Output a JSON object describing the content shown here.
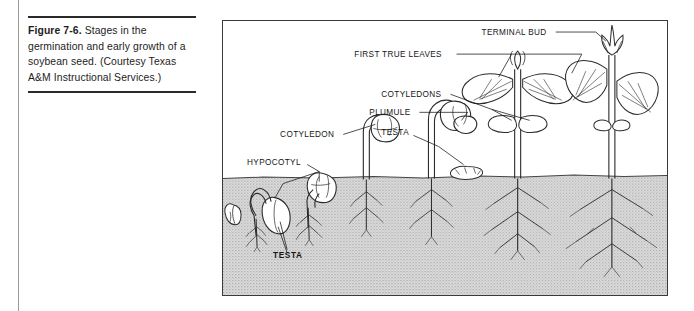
{
  "page": {
    "background": "#ffffff",
    "ink": "#2b2b2b"
  },
  "caption": {
    "label": "Figure 7-6.",
    "text": " Stages in the germination and early growth of a soybean seed. (Courtesy Texas A&M Instructional Services.)",
    "rule_color": "#2a2a2a"
  },
  "figure": {
    "border_color": "#3a3a3a",
    "soil_fill": "#d6d6d6",
    "sky_fill": "#ffffff",
    "labels": [
      {
        "id": "terminal-bud",
        "text": "TERMINAL BUD",
        "bold": false,
        "x": 258,
        "y": 14
      },
      {
        "id": "first-true-leaves",
        "text": "FIRST TRUE LEAVES",
        "bold": false,
        "x": 147,
        "y": 36
      },
      {
        "id": "cotyledons",
        "text": "COTYLEDONS",
        "bold": false,
        "x": 168,
        "y": 76
      },
      {
        "id": "plumule",
        "text": "PLUMULE",
        "bold": false,
        "x": 152,
        "y": 94
      },
      {
        "id": "testa-upper",
        "text": "TESTA",
        "bold": false,
        "x": 168,
        "y": 111
      },
      {
        "id": "cotyledon",
        "text": "COTYLEDON",
        "bold": false,
        "x": 62,
        "y": 116
      },
      {
        "id": "hypocotyl",
        "text": "HYPOCOTYL",
        "bold": false,
        "x": 30,
        "y": 146
      },
      {
        "id": "testa-lower",
        "text": "TESTA",
        "bold": true,
        "x": 58,
        "y": 236
      }
    ],
    "stages": [
      {
        "id": "stage-1-dormant-seed",
        "order": 1,
        "description": "dormant soybean seed below soil"
      },
      {
        "id": "stage-2-radicle",
        "order": 2,
        "description": "seed with emerging radicle and hypocotyl arch"
      },
      {
        "id": "stage-3-emerging",
        "order": 3,
        "description": "hypocotyl arch breaking soil surface with testa"
      },
      {
        "id": "stage-4-cotyledon",
        "order": 4,
        "description": "seedling with cotyledon and testa above ground"
      },
      {
        "id": "stage-5-plumule",
        "order": 5,
        "description": "seedling with plumule and spread cotyledons, shed testa"
      },
      {
        "id": "stage-6-first-leaves",
        "order": 6,
        "description": "young plant with first true leaves and cotyledons"
      },
      {
        "id": "stage-7-terminal-bud",
        "order": 7,
        "description": "mature seedling with terminal bud and true leaves"
      }
    ],
    "soil_line_y": 155
  }
}
